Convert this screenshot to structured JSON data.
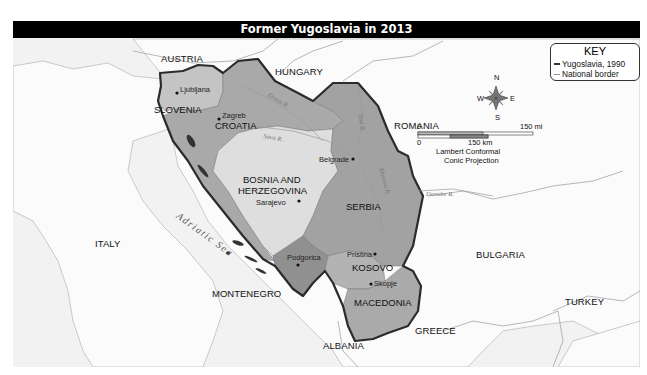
{
  "title": "Former Yugoslavia in 2013",
  "key": {
    "title": "KEY",
    "items": [
      {
        "label": "Yugoslavia, 1990",
        "symbol": "thick-dark-line",
        "color": "#333333"
      },
      {
        "label": "National border",
        "symbol": "thin-light-line",
        "color": "#999999"
      }
    ]
  },
  "compass": {
    "n": "N",
    "s": "S",
    "e": "E",
    "w": "W"
  },
  "scale": {
    "mi_zero": "0",
    "mi_max": "150 mi",
    "km_zero": "0",
    "km_max": "150 km",
    "projection_line1": "Lambert Conformal",
    "projection_line2": "Conic Projection"
  },
  "former_republics": {
    "slovenia": "SLOVENIA",
    "croatia": "CROATIA",
    "bosnia_line1": "BOSNIA AND",
    "bosnia_line2": "HERZEGOVINA",
    "serbia": "SERBIA",
    "kosovo": "KOSOVO",
    "macedonia": "MACEDONIA",
    "montenegro": "MONTENEGRO"
  },
  "neighbors": {
    "austria": "AUSTRIA",
    "hungary": "HUNGARY",
    "romania": "ROMANIA",
    "bulgaria": "BULGARIA",
    "turkey": "TURKEY",
    "greece": "GREECE",
    "albania": "ALBANIA",
    "italy": "ITALY"
  },
  "cities": {
    "ljubljana": "Ljubljana",
    "zagreb": "Zagreb",
    "belgrade": "Belgrade",
    "sarajevo": "Sarajevo",
    "podgorica": "Podgorica",
    "pristina": "Pristina",
    "skopje": "Skopje"
  },
  "water": {
    "adriatic": "Adriatic Sea",
    "drava": "Drava R.",
    "sava": "Sava R.",
    "danube": "Danube R.",
    "tisa": "Tisa R.",
    "morava": "Morava R."
  },
  "colors": {
    "background": "#f2f2f2",
    "land": "#fbfbfb",
    "slovenia": "#c4c4c4",
    "croatia": "#a9a9a9",
    "bosnia": "#dedede",
    "serbia": "#a2a2a2",
    "kosovo": "#b3b3b3",
    "macedonia": "#aaaaaa",
    "montenegro": "#909090",
    "yugoslavia_border": "#2b2b2b"
  }
}
